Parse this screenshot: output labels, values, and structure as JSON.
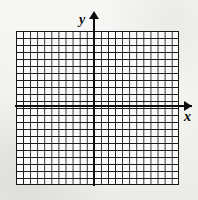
{
  "figure": {
    "background_color": "#f4f4f2",
    "width": 198,
    "height": 200
  },
  "grid": {
    "columns": 23,
    "rows": 22,
    "cell_size_px": 7,
    "line_color": "#1a1a1a",
    "cell_fill_color": "#fbfbf9",
    "border_color": "#151515",
    "left_px": 16,
    "top_px": 31,
    "width_px": 163,
    "height_px": 154,
    "columns_left_of_y_axis": 11,
    "columns_right_of_y_axis": 12,
    "rows_above_x_axis": 11,
    "rows_below_x_axis": 11
  },
  "axes": {
    "color": "#0d0d0d",
    "y": {
      "label": "y",
      "orientation": "vertical",
      "arrow_direction": "up",
      "position_px": 94
    },
    "x": {
      "label": "x",
      "orientation": "horizontal",
      "arrow_direction": "right",
      "position_px": 106
    }
  }
}
